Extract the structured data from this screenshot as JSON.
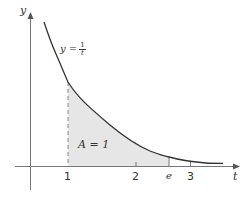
{
  "diagram": {
    "type": "function-area-plot",
    "axes": {
      "x_label": "t",
      "y_label": "y"
    },
    "curve": {
      "label_lhs": "y =",
      "label_num": "1",
      "label_den": "t"
    },
    "region": {
      "label": "A = 1",
      "from": "1",
      "to": "e"
    },
    "x_ticks": [
      {
        "label": "1"
      },
      {
        "label": "2"
      },
      {
        "label": "e"
      },
      {
        "label": "3"
      }
    ],
    "colors": {
      "curve": "#333333",
      "axes": "#777777",
      "shade": "#e6e6e6"
    }
  }
}
